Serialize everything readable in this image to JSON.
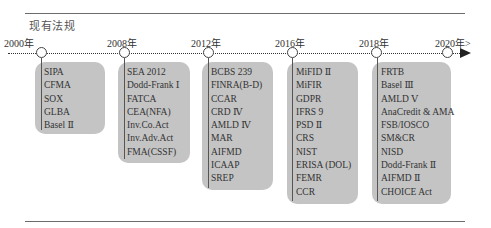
{
  "title": "现有法规",
  "timeline": {
    "arrow_label": "2020年>",
    "periods": [
      {
        "year": "2000年",
        "items": [
          "SIPA",
          "CFMA",
          "SOX",
          "GLBA",
          "Basel Ⅱ"
        ]
      },
      {
        "year": "2008年",
        "items": [
          "SEA 2012",
          "Dodd-Frank Ⅰ",
          "FATCA",
          "CEA(NFA)",
          "Inv.Co.Act",
          "Inv.Adv.Act",
          "FMA(CSSF)"
        ]
      },
      {
        "year": "2012年",
        "items": [
          "BCBS 239",
          "FINRA(B-D)",
          "CCAR",
          "CRD Ⅳ",
          "AMLD Ⅳ",
          "MAR",
          "AIFMD",
          "ICAAP",
          "SREP"
        ]
      },
      {
        "year": "2016年",
        "items": [
          "MiFID Ⅱ",
          "MiFIR",
          "GDPR",
          "IFRS 9",
          "PSD Ⅱ",
          "CRS",
          "NIST",
          "ERISA (DOL)",
          "FEMR",
          "CCR"
        ]
      },
      {
        "year": "2018年",
        "items": [
          "FRTB",
          "Basel Ⅲ",
          "AMLD Ⅴ",
          "AnaCredit & AMA",
          "FSB/IOSCO",
          "SM&CR",
          "NISD",
          "Dodd-Frank Ⅱ",
          "AIFMD Ⅱ",
          "CHOICE Act"
        ]
      }
    ]
  },
  "colors": {
    "box_fill": "#c4c4c4",
    "line": "#444444",
    "text": "#2a2a2a"
  }
}
